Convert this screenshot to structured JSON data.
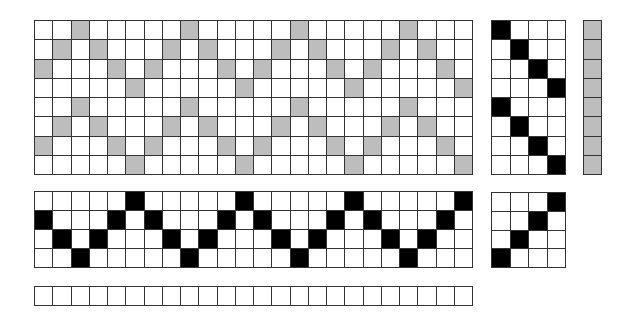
{
  "diagram": {
    "type": "weaving-draft",
    "colors": {
      "gray": "#bdbdbd",
      "black": "#000000",
      "empty": "#ffffff",
      "line": "#333333"
    },
    "drawdown": {
      "rows": 8,
      "cols": 24,
      "fill": "gray",
      "filled": [
        [
          3,
          9,
          15,
          21
        ],
        [
          2,
          4,
          8,
          10,
          14,
          16,
          20,
          22
        ],
        [
          1,
          5,
          7,
          11,
          13,
          17,
          19,
          23
        ],
        [
          6,
          12,
          18,
          24
        ],
        [
          3,
          9,
          15,
          21
        ],
        [
          2,
          4,
          8,
          10,
          14,
          16,
          20,
          22
        ],
        [
          1,
          5,
          7,
          11,
          13,
          17,
          19,
          23
        ],
        [
          6,
          12,
          18,
          24
        ]
      ]
    },
    "treadling": {
      "rows": 8,
      "cols": 4,
      "fill": "black",
      "filled": [
        [
          1
        ],
        [
          2
        ],
        [
          3
        ],
        [
          4
        ],
        [
          1
        ],
        [
          2
        ],
        [
          3
        ],
        [
          4
        ]
      ]
    },
    "weft_colors": {
      "rows": 8,
      "cols": 1,
      "fill": "gray",
      "filled": [
        [
          1
        ],
        [
          1
        ],
        [
          1
        ],
        [
          1
        ],
        [
          1
        ],
        [
          1
        ],
        [
          1
        ],
        [
          1
        ]
      ]
    },
    "threading": {
      "rows": 4,
      "cols": 24,
      "fill": "black",
      "filled": [
        [
          6,
          12,
          18,
          24
        ],
        [
          1,
          5,
          7,
          11,
          13,
          17,
          19,
          23
        ],
        [
          2,
          4,
          8,
          10,
          14,
          16,
          20,
          22
        ],
        [
          3,
          9,
          15,
          21
        ]
      ]
    },
    "tieup": {
      "rows": 4,
      "cols": 4,
      "fill": "black",
      "filled": [
        [
          4
        ],
        [
          3
        ],
        [
          2
        ],
        [
          1
        ]
      ]
    },
    "warp_colors": {
      "rows": 1,
      "cols": 24,
      "fill": "none",
      "filled": [
        []
      ]
    }
  }
}
